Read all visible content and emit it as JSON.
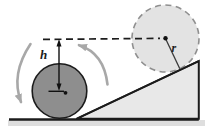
{
  "figure": {
    "name": "ball-rolling-on-incline-physics-diagram",
    "labels": {
      "height": "h",
      "radius": "r"
    },
    "colors": {
      "background": "#ffffff",
      "ink": "#1c1c1c",
      "ball_dark_fill": "#8e8e8e",
      "ball_ghost_fill": "#e3e3e3",
      "ball_ghost_stroke": "#8f8f8f",
      "incline_fill": "#e8e8e8",
      "ground_shadow": "#dedede",
      "motion_arrow": "#a8a8a8"
    }
  }
}
